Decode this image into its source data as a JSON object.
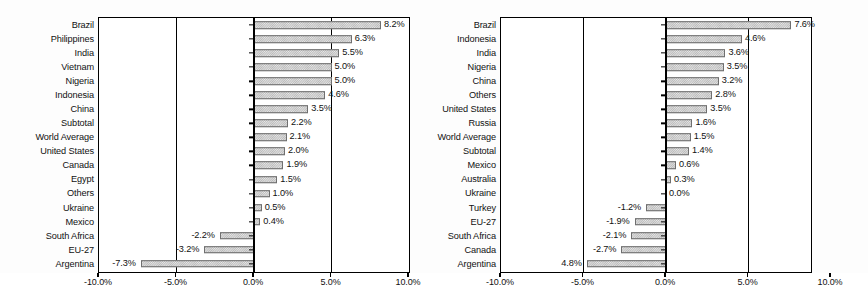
{
  "chart_data": [
    {
      "type": "bar",
      "orientation": "horizontal",
      "title": "",
      "xlabel": "",
      "ylabel": "",
      "xlim": [
        -10.0,
        10.0
      ],
      "xticks": [
        -10.0,
        -5.0,
        0.0,
        5.0,
        10.0
      ],
      "xtick_labels": [
        "-10.0%",
        "-5.0%",
        "0.0%",
        "5.0%",
        "10.0%"
      ],
      "grid": true,
      "legend": "none",
      "categories": [
        "Brazil",
        "Philippines",
        "India",
        "Vietnam",
        "Nigeria",
        "Indonesia",
        "China",
        "Subtotal",
        "World Average",
        "United States",
        "Canada",
        "Egypt",
        "Others",
        "Ukraine",
        "Mexico",
        "South Africa",
        "EU-27",
        "Argentina"
      ],
      "values": [
        8.2,
        6.3,
        5.5,
        5.0,
        5.0,
        4.6,
        3.5,
        2.2,
        2.1,
        2.0,
        1.9,
        1.5,
        1.0,
        0.5,
        0.4,
        -2.2,
        -3.2,
        -7.3
      ],
      "data_labels": [
        "8.2%",
        "6.3%",
        "5.5%",
        "5.0%",
        "5.0%",
        "4.6%",
        "3.5%",
        "2.2%",
        "2.1%",
        "2.0%",
        "1.9%",
        "1.5%",
        "1.0%",
        "0.5%",
        "0.4%",
        "-2.2%",
        "-3.2%",
        "-7.3%"
      ]
    },
    {
      "type": "bar",
      "orientation": "horizontal",
      "title": "",
      "xlabel": "",
      "ylabel": "",
      "xlim": [
        -10.0,
        10.0
      ],
      "xticks": [
        -10.0,
        -5.0,
        0.0,
        5.0,
        10.0
      ],
      "xtick_labels": [
        "-10.0%",
        "-5.0%",
        "0.0%",
        "5.0%",
        "10.0%"
      ],
      "grid": true,
      "legend": "none",
      "categories": [
        "Brazil",
        "Indonesia",
        "India",
        "Nigeria",
        "China",
        "Others",
        "United States",
        "Russia",
        "World Average",
        "Subtotal",
        "Mexico",
        "Australia",
        "Ukraine",
        "Turkey",
        "EU-27",
        "South Africa",
        "Canada",
        "Argentina"
      ],
      "values": [
        7.6,
        4.6,
        3.6,
        3.5,
        3.2,
        2.8,
        2.5,
        1.6,
        1.5,
        1.4,
        0.6,
        0.3,
        0.0,
        -1.2,
        -1.9,
        -2.1,
        -2.7,
        -4.8
      ],
      "data_labels": [
        "7.6%",
        "4.6%",
        "3.6%",
        "3.5%",
        "3.2%",
        "2.8%",
        "3.5%",
        "1.6%",
        "1.5%",
        "1.4%",
        "0.6%",
        "0.3%",
        "0.0%",
        "-1.2%",
        "-1.9%",
        "-2.1%",
        "-2.7%",
        "4.8%"
      ]
    }
  ]
}
